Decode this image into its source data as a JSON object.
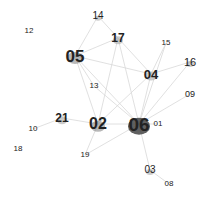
{
  "chart_data": {
    "type": "network",
    "title": "",
    "nodes": [
      {
        "id": "01",
        "x": 158,
        "y": 124,
        "size": 8,
        "blob": 0
      },
      {
        "id": "02",
        "x": 98,
        "y": 124,
        "size": 16,
        "blob": 14
      },
      {
        "id": "03",
        "x": 150,
        "y": 170,
        "size": 10,
        "blob": 8
      },
      {
        "id": "04",
        "x": 151,
        "y": 74,
        "size": 13,
        "blob": 12
      },
      {
        "id": "05",
        "x": 75,
        "y": 56,
        "size": 17,
        "blob": 16
      },
      {
        "id": "06",
        "x": 139,
        "y": 124,
        "size": 19,
        "blob": 22
      },
      {
        "id": "08",
        "x": 169,
        "y": 184,
        "size": 8,
        "blob": 0
      },
      {
        "id": "09",
        "x": 190,
        "y": 94,
        "size": 9,
        "blob": 0
      },
      {
        "id": "10",
        "x": 33,
        "y": 129,
        "size": 8,
        "blob": 0
      },
      {
        "id": "12",
        "x": 29,
        "y": 31,
        "size": 8,
        "blob": 0
      },
      {
        "id": "13",
        "x": 94,
        "y": 86,
        "size": 8,
        "blob": 0
      },
      {
        "id": "14",
        "x": 98,
        "y": 16,
        "size": 10,
        "blob": 6
      },
      {
        "id": "15",
        "x": 166,
        "y": 43,
        "size": 8,
        "blob": 0
      },
      {
        "id": "16",
        "x": 190,
        "y": 62,
        "size": 11,
        "blob": 8
      },
      {
        "id": "17",
        "x": 118,
        "y": 38,
        "size": 12,
        "blob": 10
      },
      {
        "id": "18",
        "x": 18,
        "y": 149,
        "size": 8,
        "blob": 0
      },
      {
        "id": "19",
        "x": 85,
        "y": 155,
        "size": 8,
        "blob": 0
      },
      {
        "id": "21",
        "x": 62,
        "y": 118,
        "size": 12,
        "blob": 10
      }
    ],
    "edges": [
      [
        "06",
        "02"
      ],
      [
        "06",
        "05"
      ],
      [
        "06",
        "04"
      ],
      [
        "06",
        "17"
      ],
      [
        "06",
        "03"
      ],
      [
        "06",
        "16"
      ],
      [
        "06",
        "15"
      ],
      [
        "06",
        "13"
      ],
      [
        "06",
        "19"
      ],
      [
        "06",
        "01"
      ],
      [
        "06",
        "09"
      ],
      [
        "02",
        "21"
      ],
      [
        "02",
        "05"
      ],
      [
        "02",
        "04"
      ],
      [
        "02",
        "17"
      ],
      [
        "21",
        "10"
      ],
      [
        "05",
        "14"
      ],
      [
        "05",
        "17"
      ],
      [
        "05",
        "04"
      ],
      [
        "04",
        "16"
      ],
      [
        "04",
        "15"
      ],
      [
        "04",
        "17"
      ],
      [
        "03",
        "08"
      ],
      [
        "17",
        "14"
      ],
      [
        "02",
        "19"
      ],
      [
        "05",
        "13"
      ]
    ]
  }
}
